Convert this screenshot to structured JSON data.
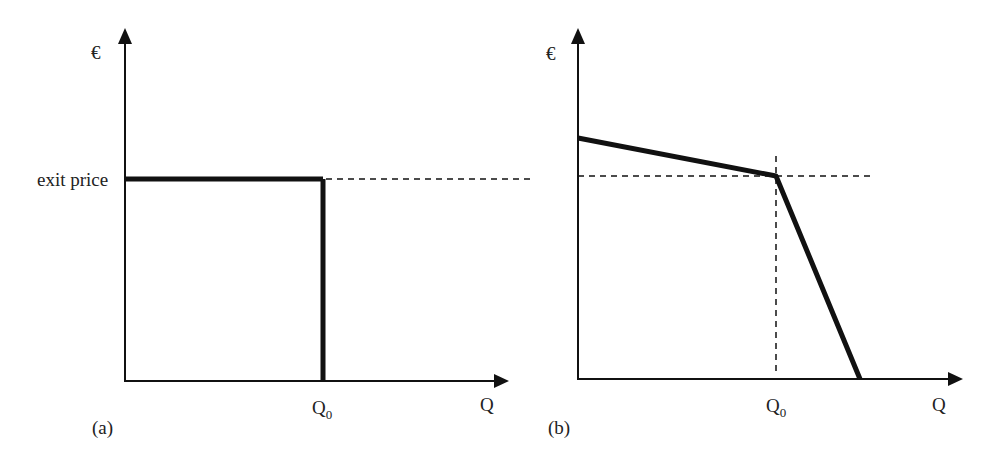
{
  "panel_a": {
    "euro": "€",
    "price_label": "exit price",
    "q0": "Q",
    "q0_sub": "0",
    "q": "Q",
    "tag": "(a)"
  },
  "panel_b": {
    "euro": "€",
    "q0": "Q",
    "q0_sub": "0",
    "q": "Q",
    "tag": "(b)"
  },
  "colors": {
    "ink": "#111111"
  }
}
